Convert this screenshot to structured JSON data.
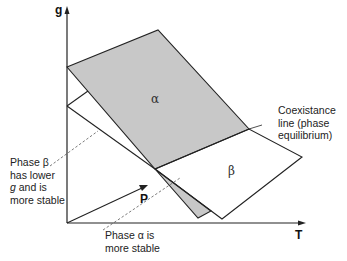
{
  "diagram": {
    "type": "gibbs-free-energy-surfaces",
    "axes": {
      "vertical": "g",
      "horizontal": "T",
      "depth": "P"
    },
    "planes": [
      {
        "name": "alpha",
        "symbol": "α",
        "fill": "#c8c8c8"
      },
      {
        "name": "beta",
        "symbol": "β",
        "fill": "#ffffff"
      }
    ],
    "annotations": {
      "coexistence": [
        "Coexistance",
        "line (phase",
        "equilibrium)"
      ],
      "beta_stable": {
        "line1": "Phase β",
        "line2": "has lower",
        "line3_italic": "g",
        "line3_rest": " and is",
        "line4": "more stable"
      },
      "alpha_stable": [
        "Phase α is",
        "more stable"
      ]
    },
    "colors": {
      "line": "#222222",
      "shade": "#c8c8c8",
      "background": "#ffffff"
    }
  }
}
